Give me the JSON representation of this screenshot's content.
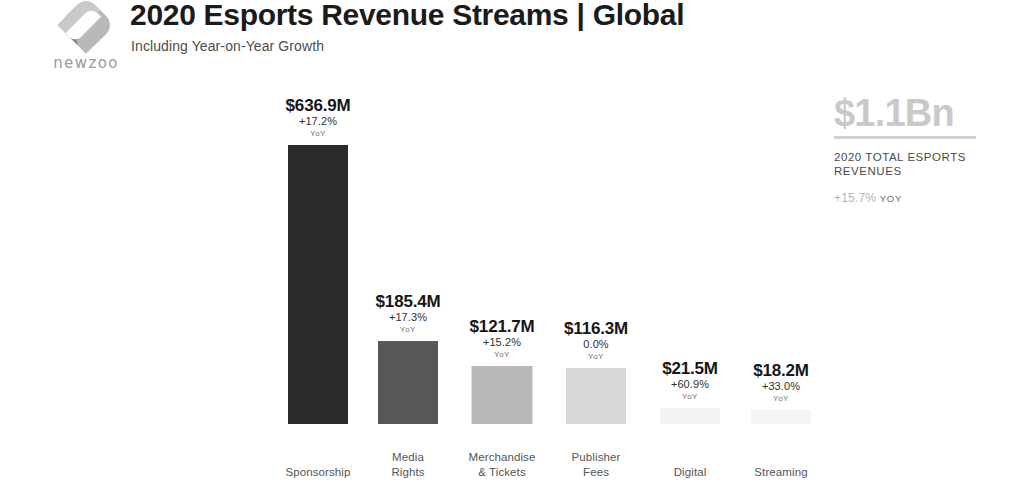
{
  "header": {
    "logo_word": "newzoo",
    "logo_icon": "newzoo-diamond-logo",
    "title": "2020 Esports Revenue Streams | Global",
    "subtitle": "Including Year-on-Year Growth"
  },
  "total_panel": {
    "value": "$1.1Bn",
    "caption": "2020 TOTAL ESPORTS REVENUES",
    "growth": "+15.7%",
    "growth_suffix": "YOY"
  },
  "chart_data": {
    "type": "bar",
    "title": "2020 Esports Revenue Streams | Global",
    "subtitle": "Including Year-on-Year Growth",
    "xlabel": "",
    "ylabel": "",
    "ylim": [
      0,
      700
    ],
    "grid": false,
    "legend": "none",
    "unit": "USD millions",
    "yoy_label": "YoY",
    "categories": [
      "Sponsorship",
      "Media Rights",
      "Merchandise & Tickets",
      "Publisher Fees",
      "Digital",
      "Streaming"
    ],
    "values": [
      636.9,
      185.4,
      121.7,
      116.3,
      21.5,
      18.2
    ],
    "value_labels": [
      "$636.9M",
      "$185.4M",
      "$121.7M",
      "$116.3M",
      "$21.5M",
      "$18.2M"
    ],
    "yoy_growth": [
      17.2,
      17.3,
      15.2,
      0.0,
      60.9,
      33.0
    ],
    "yoy_labels": [
      "+17.2%",
      "+17.3%",
      "+15.2%",
      "0.0%",
      "+60.9%",
      "+33.0%"
    ],
    "bar_colors": [
      "#2b2b2b",
      "#575757",
      "#b8b8b8",
      "#d8d8d8",
      "#f2f2f2",
      "#f4f4f4"
    ],
    "total": "$1.1Bn",
    "total_growth": "+15.7%"
  },
  "bars": [
    {
      "category_line1": "Sponsorship",
      "category_line2": "",
      "value_label": "$636.9M",
      "yoy_label": "+17.2%",
      "yoy_suffix": "YoY",
      "color": "#2b2b2b",
      "center_x": 318,
      "width": 60,
      "height": 279
    },
    {
      "category_line1": "Media",
      "category_line2": "Rights",
      "value_label": "$185.4M",
      "yoy_label": "+17.3%",
      "yoy_suffix": "YoY",
      "color": "#575757",
      "center_x": 408,
      "width": 60,
      "height": 83
    },
    {
      "category_line1": "Merchandise",
      "category_line2": "& Tickets",
      "value_label": "$121.7M",
      "yoy_label": "+15.2%",
      "yoy_suffix": "YoY",
      "color": "#b8b8b8",
      "center_x": 502,
      "width": 61,
      "height": 58
    },
    {
      "category_line1": "Publisher",
      "category_line2": "Fees",
      "value_label": "$116.3M",
      "yoy_label": "0.0%",
      "yoy_suffix": "YoY",
      "color": "#d8d8d8",
      "center_x": 596,
      "width": 60,
      "height": 56
    },
    {
      "category_line1": "Digital",
      "category_line2": "",
      "value_label": "$21.5M",
      "yoy_label": "+60.9%",
      "yoy_suffix": "YoY",
      "color": "#f2f2f2",
      "center_x": 690,
      "width": 60,
      "height": 16
    },
    {
      "category_line1": "Streaming",
      "category_line2": "",
      "value_label": "$18.2M",
      "yoy_label": "+33.0%",
      "yoy_suffix": "YoY",
      "color": "#f4f4f4",
      "center_x": 781,
      "width": 60,
      "height": 14
    }
  ]
}
